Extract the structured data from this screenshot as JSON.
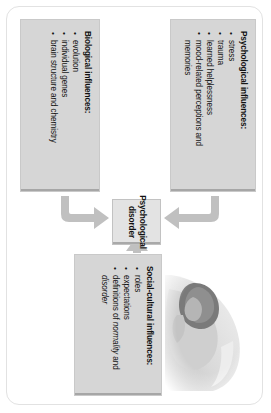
{
  "diagram": {
    "rotation_degrees": 90,
    "center": {
      "label": "Psychological disorder",
      "name": "psychological-disorder"
    },
    "boxes": [
      {
        "id": "psychological",
        "title": "Psychological influences:",
        "items": [
          {
            "text": "stress",
            "italic_part": ""
          },
          {
            "text": "trauma",
            "italic_part": ""
          },
          {
            "text": "learned helplessness",
            "italic_part": ""
          },
          {
            "text": "mood-related perceptions and memories",
            "italic_part": ""
          }
        ]
      },
      {
        "id": "biological",
        "title": "Biological influences:",
        "items": [
          {
            "text": "evolution",
            "italic_part": ""
          },
          {
            "text": "individual genes",
            "italic_part": ""
          },
          {
            "text": "brain structure and chemistry",
            "italic_part": ""
          }
        ]
      },
      {
        "id": "social-cultural",
        "title": "Social-cultural influences:",
        "items": [
          {
            "text": "roles",
            "italic_part": ""
          },
          {
            "text": "expectations",
            "italic_part": ""
          },
          {
            "text": "definitions of ",
            "italic_part": "normality",
            "text_mid": " and ",
            "italic_part2": "disorder"
          }
        ]
      }
    ],
    "arrows": [
      {
        "name": "arrow-psychological-to-center",
        "from": "psychological",
        "to": "center",
        "shape": "elbow-down"
      },
      {
        "name": "arrow-biological-to-center",
        "from": "biological",
        "to": "center",
        "shape": "elbow-up"
      },
      {
        "name": "arrow-social-to-center",
        "from": "social-cultural",
        "to": "center",
        "shape": "straight-left"
      }
    ],
    "photo": {
      "name": "distressed-person-photo",
      "description": "Faded grayscale photograph of a person with head lowered resting on an arm"
    }
  },
  "colors": {
    "box_fill": "#d6d6d6",
    "center_fill": "#e3e3e3",
    "arrow": "#c0c0c0",
    "text": "#111111",
    "frame_border": "#e2e2e2",
    "page_background": "#ffffff"
  }
}
